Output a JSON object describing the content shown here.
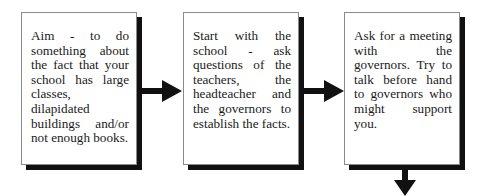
{
  "diagram": {
    "type": "flowchart",
    "steps": [
      {
        "id": 1,
        "text": "Aim - to do something about the fact that your school has large classes, dilapidated buildings and/or not enough books."
      },
      {
        "id": 2,
        "text": "Start with the school - ask questions of the teachers, the headteacher and the governors to establish the facts."
      },
      {
        "id": 3,
        "text": "Ask for a meeting with the governors. Try to talk before hand to governors who might support you."
      }
    ],
    "connectors": [
      {
        "from": 1,
        "to": 2,
        "direction": "right"
      },
      {
        "from": 2,
        "to": 3,
        "direction": "right"
      },
      {
        "from": 3,
        "to": "next",
        "direction": "down"
      }
    ]
  },
  "colors": {
    "shadow": "#111111",
    "arrow": "#111111",
    "border": "#8a8a8a"
  }
}
